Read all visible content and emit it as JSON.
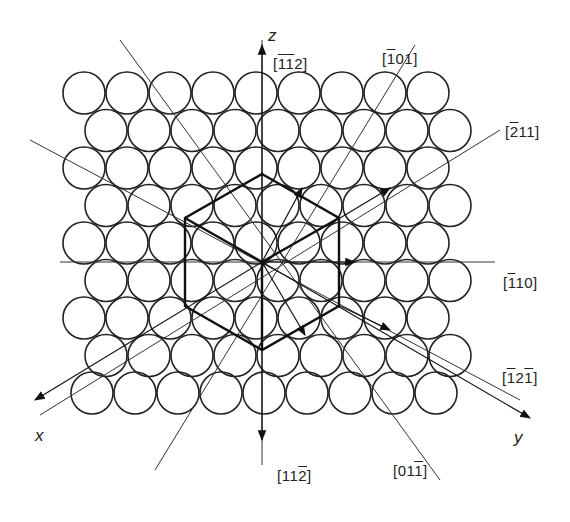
{
  "figure": {
    "grid": {
      "rows": 9,
      "circles_per_row": 9,
      "circle_radius": 21,
      "spacing_x": 43,
      "spacing_y": 37.5,
      "origin_x": 84,
      "origin_y": 93,
      "row_offsets": [
        0,
        22,
        0,
        22,
        0,
        22,
        0,
        22,
        8
      ]
    },
    "center": {
      "x": 262,
      "y": 262
    },
    "hexagon_radius": 88,
    "axes": {
      "z": {
        "label": "z"
      },
      "x": {
        "label": "x"
      },
      "y": {
        "label": "y"
      }
    },
    "directions": [
      {
        "id": "m1m12",
        "parts": [
          {
            "t": "[",
            "o": false
          },
          {
            "t": "1",
            "o": true
          },
          {
            "t": "1",
            "o": true
          },
          {
            "t": "2]",
            "o": false
          }
        ],
        "text": "[-1-12]"
      },
      {
        "id": "m101",
        "parts": [
          {
            "t": "[",
            "o": false
          },
          {
            "t": "1",
            "o": true
          },
          {
            "t": "01]",
            "o": false
          }
        ],
        "text": "[-101]"
      },
      {
        "id": "m211",
        "parts": [
          {
            "t": "[",
            "o": false
          },
          {
            "t": "2",
            "o": true
          },
          {
            "t": "11]",
            "o": false
          }
        ],
        "text": "[-211]"
      },
      {
        "id": "m110",
        "parts": [
          {
            "t": "[",
            "o": false
          },
          {
            "t": "1",
            "o": true
          },
          {
            "t": "10]",
            "o": false
          }
        ],
        "text": "[-110]"
      },
      {
        "id": "m12m1",
        "parts": [
          {
            "t": "[",
            "o": false
          },
          {
            "t": "1",
            "o": true
          },
          {
            "t": "2",
            "o": false
          },
          {
            "t": "1",
            "o": true
          },
          {
            "t": "]",
            "o": false
          }
        ],
        "text": "[-12-1]"
      },
      {
        "id": "01m1",
        "parts": [
          {
            "t": "[01",
            "o": false
          },
          {
            "t": "1",
            "o": true
          },
          {
            "t": "]",
            "o": false
          }
        ],
        "text": "[01-1]"
      },
      {
        "id": "11m2",
        "parts": [
          {
            "t": "[11",
            "o": false
          },
          {
            "t": "2",
            "o": true
          },
          {
            "t": "]",
            "o": false
          }
        ],
        "text": "[11-2]"
      }
    ]
  }
}
